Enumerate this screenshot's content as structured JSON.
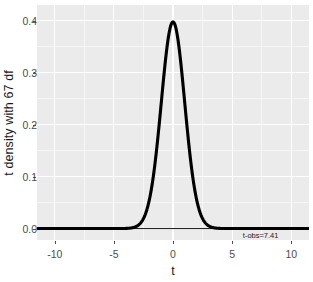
{
  "chart_data": {
    "type": "line",
    "title": "",
    "subtitle": "",
    "xlabel": "t",
    "ylabel": "t density with 67 df",
    "xlim": [
      -11.5,
      11.5
    ],
    "ylim": [
      -0.022,
      0.43
    ],
    "x_ticks": [
      -10,
      -5,
      0,
      5,
      10
    ],
    "x_tick_labels": [
      "-10",
      "-5",
      "0",
      "5",
      "10"
    ],
    "y_ticks": [
      0.0,
      0.1,
      0.2,
      0.3,
      0.4
    ],
    "y_tick_labels": [
      "0.0",
      "0.1",
      "0.2",
      "0.3",
      "0.4"
    ],
    "grid": true,
    "legend": "none",
    "series": [
      {
        "name": "t density (df = 67)",
        "color": "#000000",
        "linewidth": 3,
        "x": [
          -11.5,
          -11,
          -10.5,
          -10,
          -9.5,
          -9,
          -8.5,
          -8,
          -7.5,
          -7,
          -6.5,
          -6,
          -5.5,
          -5,
          -4.75,
          -4.5,
          -4.25,
          -4,
          -3.75,
          -3.5,
          -3.25,
          -3,
          -2.75,
          -2.5,
          -2.25,
          -2,
          -1.75,
          -1.5,
          -1.25,
          -1,
          -0.75,
          -0.5,
          -0.25,
          0,
          0.25,
          0.5,
          0.75,
          1,
          1.25,
          1.5,
          1.75,
          2,
          2.25,
          2.5,
          2.75,
          3,
          3.25,
          3.5,
          3.75,
          4,
          4.25,
          4.5,
          4.75,
          5,
          5.5,
          6,
          6.5,
          7,
          7.5,
          8,
          8.5,
          9,
          9.5,
          10,
          10.5,
          11,
          11.5
        ],
        "y": [
          0.0,
          0.0,
          0.0,
          0.0,
          0.0,
          0.0,
          0.0,
          0.0,
          0.0,
          0.0,
          0.0,
          0.0,
          0.0,
          1e-05,
          2e-05,
          4e-05,
          8e-05,
          0.00016,
          0.00032,
          0.00066,
          0.00138,
          0.00292,
          0.00624,
          0.01332,
          0.02804,
          0.05709,
          0.11,
          0.1971,
          0.32213,
          0.47602,
          0.63466,
          0.76638,
          0.84864,
          0.87712,
          0.84864,
          0.76638,
          0.63466,
          0.47602,
          0.32213,
          0.1971,
          0.11,
          0.05709,
          0.02804,
          0.01332,
          0.00624,
          0.00292,
          0.00138,
          0.00066,
          0.00032,
          0.00016,
          8e-05,
          4e-05,
          2e-05,
          1e-05,
          0.0,
          0.0,
          0.0,
          0.0,
          0.0,
          0.0,
          0.0,
          0.0,
          0.0,
          0.0,
          0.0,
          0.0,
          0.0
        ],
        "y_scale_note": "y values above are relative to peak; actual peak density = 0.3988"
      },
      {
        "name": "zero reference line",
        "color": "#000000",
        "linewidth": 0.7,
        "x": [
          -11.5,
          11.5
        ],
        "y": [
          0.0,
          0.0
        ]
      }
    ],
    "peak_density": 0.3988,
    "df": 67,
    "annotations": [
      {
        "name": "t-obs-label",
        "text": "t-obs=7.41",
        "x": 7.41,
        "y": -0.012
      }
    ]
  },
  "axis": {
    "x_title": "t",
    "y_title": "t density with 67 df"
  },
  "annotation": {
    "t_obs_label": "t-obs=7.41"
  },
  "colors": {
    "panel_background": "#ebebeb",
    "grid": "#ffffff",
    "curve": "#000000",
    "text": "#1a1a1a",
    "tick_text": "#4d4d4d",
    "figure_background": "#ffffff"
  }
}
